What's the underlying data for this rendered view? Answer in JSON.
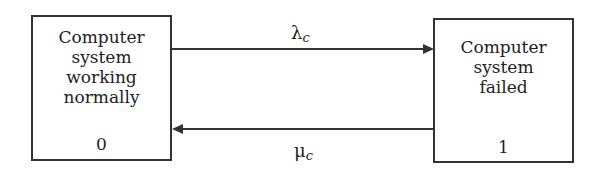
{
  "diagram": {
    "type": "state-transition",
    "states": [
      {
        "id": "0",
        "label_lines": [
          "Computer",
          "system",
          "working",
          "normally"
        ],
        "number": "0"
      },
      {
        "id": "1",
        "label_lines": [
          "Computer",
          "system",
          "failed"
        ],
        "number": "1"
      }
    ],
    "transitions": [
      {
        "from": "0",
        "to": "1",
        "symbol": "λ",
        "subscript": "c"
      },
      {
        "from": "1",
        "to": "0",
        "symbol": "μ",
        "subscript": "c"
      }
    ]
  }
}
